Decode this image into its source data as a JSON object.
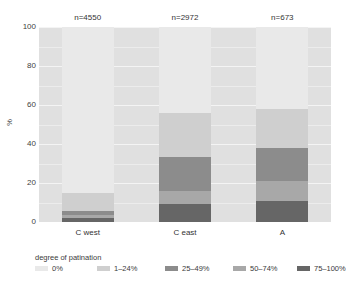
{
  "chart_data": {
    "type": "bar",
    "subtype": "stacked-percent",
    "title": "",
    "xlabel": "",
    "ylabel": "%",
    "ylim": [
      0,
      100
    ],
    "yticks": [
      0,
      20,
      40,
      60,
      80,
      100
    ],
    "ytick_labels": [
      "0",
      "20",
      "40",
      "60",
      "80",
      "100"
    ],
    "grid": true,
    "legend_title": "degree of patination",
    "legend_position": "bottom",
    "categories": [
      "C west",
      "C east",
      "A"
    ],
    "group_counts": [
      "n=4550",
      "n=2972",
      "n=673"
    ],
    "counts": [
      4550,
      2972,
      673
    ],
    "series": [
      {
        "name": "0%",
        "color": "#e9e9e9",
        "values": [
          85.0,
          44.0,
          42.0
        ]
      },
      {
        "name": "1–24%",
        "color": "#cfcfcf",
        "values": [
          9.5,
          22.5,
          20.0
        ]
      },
      {
        "name": "25–49%",
        "color": "#8c8c8c",
        "values": [
          2.0,
          17.5,
          17.0
        ]
      },
      {
        "name": "50–74%",
        "color": "#a8a8a8",
        "values": [
          1.5,
          7.0,
          10.0
        ]
      },
      {
        "name": "75–100%",
        "color": "#666666",
        "values": [
          2.0,
          9.0,
          11.0
        ]
      }
    ]
  },
  "axis": {
    "y_title": "%",
    "y_tick_0": "0",
    "y_tick_20": "20",
    "y_tick_40": "40",
    "y_tick_60": "60",
    "y_tick_80": "80",
    "y_tick_100": "100"
  },
  "columns": [
    {
      "n_label": "n=4550",
      "x_label": "C west"
    },
    {
      "n_label": "n=2972",
      "x_label": "C east"
    },
    {
      "n_label": "n=673",
      "x_label": "A"
    }
  ],
  "legend": {
    "title": "degree of patination",
    "items": [
      {
        "label": "0%",
        "color": "#e9e9e9"
      },
      {
        "label": "1–24%",
        "color": "#cfcfcf"
      },
      {
        "label": "25–49%",
        "color": "#8c8c8c"
      },
      {
        "label": "50–74%",
        "color": "#a8a8a8"
      },
      {
        "label": "75–100%",
        "color": "#666666"
      }
    ]
  },
  "colors": {
    "panel_background": "#e0e0e0",
    "gridline": "#f4f4f4",
    "page_background": "#ffffff",
    "text": "#3a3a3a"
  }
}
